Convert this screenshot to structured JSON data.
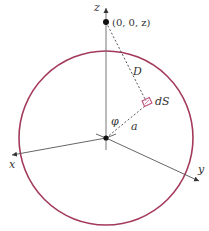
{
  "diagram": {
    "labels": {
      "z_axis": "z",
      "x_axis": "x",
      "y_axis": "y",
      "point": "(0, 0, z)",
      "distance": "D",
      "surface_element": "dS",
      "angle": "φ",
      "radius": "a"
    },
    "colors": {
      "sphere": "#a33a5a",
      "surface_element": "#c0507a",
      "axes": "#555555",
      "text": "#333333"
    }
  }
}
